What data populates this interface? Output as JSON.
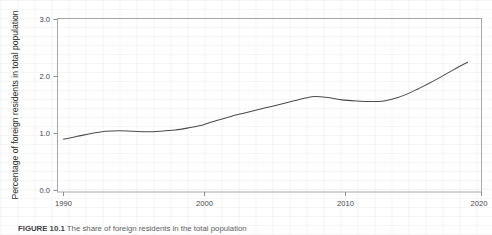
{
  "figure": {
    "caption_label": "FIGURE 10.1",
    "caption_text": "The share of foreign residents in the total population"
  },
  "chart_data": {
    "type": "line",
    "title": "",
    "subtitle": "",
    "xlabel": "",
    "ylabel": "Percentage of foreign residents in total population",
    "xlim": [
      1989,
      2020
    ],
    "ylim": [
      0.0,
      3.15
    ],
    "grid": false,
    "legend": false,
    "legend_position": "none",
    "line_color": "#4a4a4a",
    "axis_color": "#9a9a9f",
    "xticks": [
      1990,
      2000,
      2010,
      2020
    ],
    "xtick_labels": [
      "1990",
      "2000",
      "2010",
      "2020"
    ],
    "yticks": [
      0.0,
      1.0,
      2.0,
      3.0
    ],
    "ytick_labels": [
      "0.0",
      "1.0",
      "2.0",
      "3.0"
    ],
    "series": [
      {
        "name": "Percentage of foreign residents in total population",
        "x": [
          1990,
          1991,
          1992,
          1993,
          1994,
          1995,
          1996,
          1997,
          1998,
          1999,
          2000,
          2001,
          2002,
          2003,
          2004,
          2005,
          2006,
          2007,
          2008,
          2009,
          2010,
          2011,
          2012,
          2013,
          2014,
          2015,
          2016,
          2017,
          2018,
          2019
        ],
        "values": [
          0.9,
          0.95,
          1.0,
          1.04,
          1.05,
          1.04,
          1.03,
          1.04,
          1.06,
          1.1,
          1.15,
          1.23,
          1.3,
          1.36,
          1.42,
          1.48,
          1.54,
          1.6,
          1.65,
          1.63,
          1.59,
          1.57,
          1.56,
          1.57,
          1.63,
          1.73,
          1.85,
          1.98,
          2.12,
          2.25
        ]
      }
    ],
    "annotations": []
  }
}
